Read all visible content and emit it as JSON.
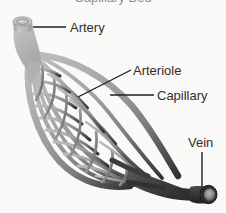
{
  "figure": {
    "kind": "anatomical-diagram",
    "width": 226,
    "height": 213,
    "background_color": "#fbfbfa",
    "title_partial": "Capillary Bed",
    "title_note": "top of title text is cropped off the top edge of the image"
  },
  "labels": {
    "artery": "Artery",
    "arteriole": "Arteriole",
    "capillary": "Capillary",
    "vein": "Vein"
  },
  "colors": {
    "artery_light": "#b8b8b8",
    "artery_mid": "#a8a8a8",
    "capillary_mid": "#8e8e8e",
    "vein_dark": "#3c3c3c",
    "vein_darkest": "#242424",
    "lumen_fill": "#cfcfcf",
    "lumen_inner": "#9a9a9a",
    "leader_line": "#1c1c1c",
    "text": "#2b2b2b",
    "background": "#fbfbfa"
  },
  "structures": [
    {
      "name": "artery",
      "label": "Artery",
      "description": "thick light-gray vessel entering from upper left with open circular lumen"
    },
    {
      "name": "arteriole",
      "label": "Arteriole",
      "description": "branching vessels fanning out from the artery into the bed"
    },
    {
      "name": "capillary",
      "label": "Capillary",
      "description": "dense lens-shaped mesh of fine vessels between arteriole and venule"
    },
    {
      "name": "vein",
      "label": "Vein",
      "description": "thick dark vessel exiting to lower right with open circular lumen"
    }
  ],
  "leader_lines": [
    {
      "for": "artery",
      "type": "horizontal",
      "from": [
        33,
        27
      ],
      "to": [
        66,
        27
      ]
    },
    {
      "for": "arteriole",
      "type": "diagonal",
      "from": [
        78,
        97
      ],
      "to": [
        131,
        70
      ]
    },
    {
      "for": "capillary",
      "type": "horizontal",
      "from": [
        110,
        95
      ],
      "to": [
        154,
        95
      ]
    },
    {
      "for": "vein",
      "type": "vertical",
      "from": [
        202,
        152
      ],
      "to": [
        202,
        187
      ]
    }
  ]
}
